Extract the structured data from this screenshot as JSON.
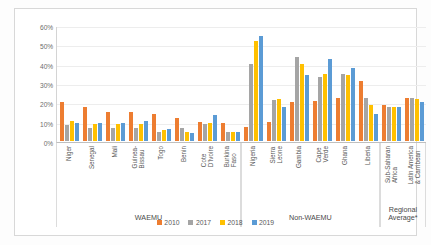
{
  "chart_data": {
    "type": "bar",
    "title": "",
    "subtitle": "",
    "xlabel": "",
    "ylabel": "",
    "ylim": [
      0,
      60
    ],
    "yticks": [
      0,
      10,
      20,
      30,
      40,
      50,
      60
    ],
    "ytick_labels": [
      "0%",
      "10%",
      "20%",
      "30%",
      "40%",
      "50%",
      "60%"
    ],
    "grid": true,
    "legend_position": "bottom",
    "legend": [
      "2010",
      "2017",
      "2018",
      "2019"
    ],
    "series_colors": [
      "#ED7D31",
      "#A5A5A5",
      "#FFC000",
      "#5B9BD5"
    ],
    "categories": [
      "Niger",
      "Senegal",
      "Mali",
      "Guinea-\nBissau",
      "Togo",
      "Benin",
      "Cote\nD'Ivoire",
      "Burkina\nFaso",
      "Nigeria",
      "Sierra\nLeone",
      "Gambia",
      "Cape\nVerde",
      "Ghana",
      "Liberia",
      "Sub-Saharan\nAfrica",
      "Latin America\n& Carribean"
    ],
    "series": [
      {
        "name": "2010",
        "values": [
          20.0,
          17.8,
          15.2,
          15.1,
          14.1,
          11.7,
          9.7,
          9.1,
          7.3,
          10.0,
          20.3,
          20.7,
          22.3,
          30.8,
          18.6,
          22.4
        ]
      },
      {
        "name": "2017",
        "values": [
          8.2,
          6.5,
          6.8,
          6.9,
          4.6,
          6.5,
          8.7,
          4.9,
          39.6,
          21.3,
          43.4,
          33.1,
          34.6,
          22.4,
          17.4,
          22.1
        ]
      },
      {
        "name": "2018",
        "values": [
          10.3,
          8.8,
          9.0,
          8.9,
          5.6,
          4.5,
          9.1,
          4.9,
          51.7,
          21.5,
          39.8,
          34.8,
          33.9,
          18.4,
          17.7,
          21.5
        ]
      },
      {
        "name": "2019",
        "values": [
          9.2,
          9.4,
          9.4,
          10.5,
          6.4,
          4.2,
          13.4,
          4.7,
          54.4,
          17.8,
          34.3,
          42.5,
          37.6,
          13.9,
          17.4,
          20.0
        ]
      }
    ],
    "groups": [
      {
        "label": "WAEMU",
        "start": 0,
        "end": 7
      },
      {
        "label": "Non-WAEMU",
        "start": 8,
        "end": 13
      },
      {
        "label": "Regional\nAverage*",
        "start": 14,
        "end": 15
      }
    ]
  }
}
